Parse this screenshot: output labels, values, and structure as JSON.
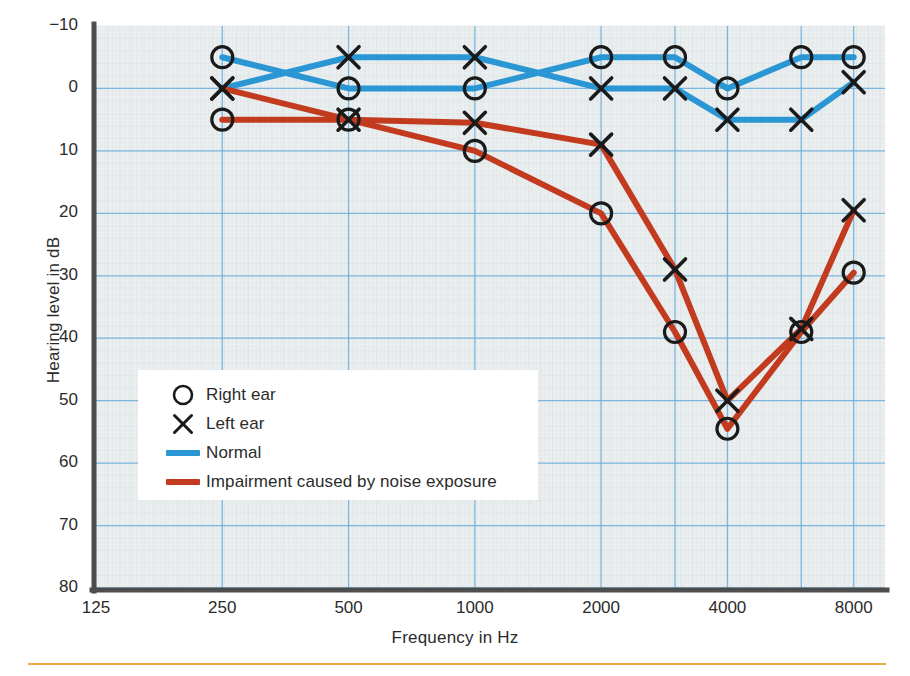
{
  "chart_data": {
    "type": "line",
    "title": "",
    "xlabel": "Frequency in Hz",
    "ylabel": "Hearing level in dB",
    "x": [
      250,
      500,
      1000,
      2000,
      3000,
      4000,
      6000,
      8000
    ],
    "xtick_labels": [
      "125",
      "250",
      "500",
      "1000",
      "2000",
      "4000",
      "8000"
    ],
    "xtick_values": [
      125,
      250,
      500,
      1000,
      2000,
      4000,
      8000
    ],
    "xlim": [
      125,
      9500
    ],
    "xscale": "log",
    "ytick_labels": [
      "−10",
      "0",
      "10",
      "20",
      "30",
      "40",
      "50",
      "60",
      "70",
      "80"
    ],
    "ytick_values": [
      -10,
      0,
      10,
      20,
      30,
      40,
      50,
      60,
      70,
      80
    ],
    "ylim": [
      -10,
      80
    ],
    "y_inverted": true,
    "grid": true,
    "legend_position": "inside-lower-left",
    "series": [
      {
        "name": "Normal — Right ear",
        "marker": "circle",
        "color": "#2a96d3",
        "values": [
          -5,
          0,
          0,
          -5,
          -5,
          0,
          -5,
          -5
        ]
      },
      {
        "name": "Normal — Left ear",
        "marker": "cross",
        "color": "#2a96d3",
        "values": [
          0,
          -5,
          -5,
          0,
          0,
          5,
          5,
          -1
        ]
      },
      {
        "name": "Impairment caused by noise exposure — Right ear",
        "marker": "circle",
        "color": "#c23b1e",
        "values": [
          5,
          5,
          10,
          20,
          39,
          54.5,
          39,
          29.5
        ]
      },
      {
        "name": "Impairment caused by noise exposure — Left ear",
        "marker": "cross",
        "color": "#c23b1e",
        "values": [
          0,
          5,
          5.5,
          9,
          29,
          50,
          38.5,
          19.5
        ]
      }
    ]
  },
  "legend": {
    "items": [
      {
        "key": "circle-marker",
        "label": "Right ear",
        "color": "#1a1a1a"
      },
      {
        "key": "cross-marker",
        "label": "Left ear",
        "color": "#1a1a1a"
      },
      {
        "key": "line-swatch",
        "label": "Normal",
        "color": "#2a96d3"
      },
      {
        "key": "line-swatch",
        "label": "Impairment caused by noise exposure",
        "color": "#c23b1e"
      }
    ]
  },
  "style": {
    "plot_background": "#e9edee",
    "grid_color": "#6aaede",
    "minor_grid_color": "#d5dcdf",
    "axis_color": "#4d4d4d",
    "blue": "#2a96d3",
    "red": "#c23b1e",
    "marker_color": "#1a1a1a",
    "rule_color": "#efa944"
  }
}
